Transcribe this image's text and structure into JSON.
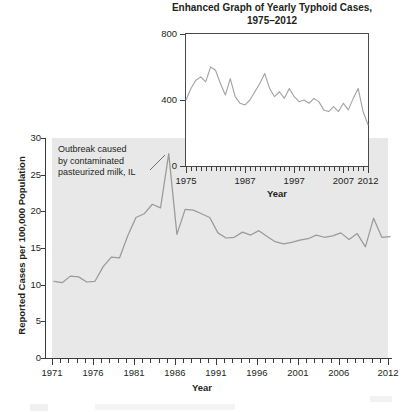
{
  "chart_data": [
    {
      "type": "line",
      "id": "inset-typhoid-cases",
      "title": "Enhanced Graph of Yearly Typhoid Cases, 1975–2012",
      "title_line1": "Enhanced Graph of Yearly Typhoid Cases,",
      "title_line2": "1975–2012",
      "xlabel": "Year",
      "ylabel": "",
      "xlim": [
        1975,
        2012
      ],
      "ylim": [
        0,
        800
      ],
      "ytick_labels": [
        "0",
        "400",
        "800"
      ],
      "ytick_values": [
        0,
        400,
        800
      ],
      "xtick_labels": [
        "1975",
        "1987",
        "1997",
        "2007",
        "2012"
      ],
      "xtick_values": [
        1975,
        1987,
        1997,
        2007,
        2012
      ],
      "grid": false,
      "legend": "none",
      "line_color": "#9a9a9a",
      "x": [
        1975,
        1976,
        1977,
        1978,
        1979,
        1980,
        1981,
        1982,
        1983,
        1984,
        1985,
        1986,
        1987,
        1988,
        1989,
        1990,
        1991,
        1992,
        1993,
        1994,
        1995,
        1996,
        1997,
        1998,
        1999,
        2000,
        2001,
        2002,
        2003,
        2004,
        2005,
        2006,
        2007,
        2008,
        2009,
        2010,
        2011,
        2012
      ],
      "values": [
        400,
        470,
        520,
        540,
        510,
        600,
        580,
        500,
        430,
        530,
        420,
        380,
        370,
        400,
        450,
        500,
        560,
        470,
        420,
        450,
        410,
        470,
        420,
        390,
        400,
        380,
        410,
        390,
        340,
        330,
        360,
        330,
        380,
        340,
        410,
        470,
        330,
        250
      ]
    },
    {
      "type": "line",
      "id": "main-typhoid-cases",
      "title": "",
      "xlabel": "Year",
      "ylabel": "Reported Cases per 100,000 Population",
      "xlim": [
        1971,
        2012
      ],
      "ylim": [
        0,
        30
      ],
      "ytick_labels": [
        "0",
        "5",
        "10",
        "15",
        "20",
        "25",
        "30"
      ],
      "ytick_values": [
        0,
        5,
        10,
        15,
        20,
        25,
        30
      ],
      "xtick_labels": [
        "1971",
        "1976",
        "1981",
        "1986",
        "1991",
        "1996",
        "2001",
        "2006",
        "2012"
      ],
      "xtick_values": [
        1971,
        1976,
        1981,
        1986,
        1991,
        1996,
        2001,
        2006,
        2012
      ],
      "grid": false,
      "legend": "none",
      "line_color": "#9a9a9a",
      "panel_background": "#e8e8e8",
      "annotation": {
        "text": "Outbreak caused by contaminated pasteurized milk, IL",
        "line1": "Outbreak caused",
        "line2": "by contaminated",
        "line3": "pasteurized milk, IL",
        "points_to_year": 1985,
        "points_to_value": 28
      },
      "x": [
        1971,
        1972,
        1973,
        1974,
        1975,
        1976,
        1977,
        1978,
        1979,
        1980,
        1981,
        1982,
        1983,
        1984,
        1985,
        1986,
        1987,
        1988,
        1989,
        1990,
        1991,
        1992,
        1993,
        1994,
        1995,
        1996,
        1997,
        1998,
        1999,
        2000,
        2001,
        2002,
        2003,
        2004,
        2005,
        2006,
        2007,
        2008,
        2009,
        2010,
        2011,
        2012
      ],
      "values": [
        10.6,
        10.4,
        11.3,
        11.2,
        10.5,
        10.6,
        12.6,
        13.9,
        13.8,
        16.8,
        19.3,
        19.8,
        21.1,
        20.6,
        28.0,
        17.0,
        20.4,
        20.3,
        19.8,
        19.3,
        17.2,
        16.5,
        16.6,
        17.3,
        16.9,
        17.5,
        16.7,
        16.0,
        15.7,
        15.9,
        16.2,
        16.4,
        16.9,
        16.6,
        16.8,
        17.2,
        16.3,
        17.1,
        15.3,
        19.2,
        16.6,
        16.7
      ]
    }
  ]
}
